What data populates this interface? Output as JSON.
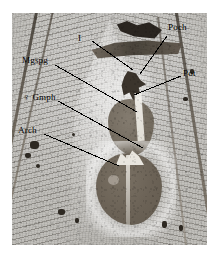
{
  "figure": {
    "kind": "histological-section-micrograph",
    "caption_labels_present": true
  },
  "labels": [
    {
      "id": "I",
      "text": "I",
      "symbol": "",
      "x": 78,
      "y": 33,
      "leader": {
        "x1": 92,
        "y1": 41,
        "x2": 133,
        "y2": 70
      }
    },
    {
      "id": "Mgspg",
      "text": "Mgspg",
      "symbol": "",
      "x": 22,
      "y": 55,
      "leader": {
        "x1": 55,
        "y1": 65,
        "x2": 137,
        "y2": 112
      }
    },
    {
      "id": "Gmph",
      "text": "Gmph",
      "symbol": "♀",
      "x": 23,
      "y": 92,
      "leader": {
        "x1": 58,
        "y1": 101,
        "x2": 143,
        "y2": 148
      }
    },
    {
      "id": "Arch",
      "text": "Arch",
      "symbol": "",
      "x": 18,
      "y": 125,
      "leader": {
        "x1": 44,
        "y1": 134,
        "x2": 119,
        "y2": 166
      }
    },
    {
      "id": "Poch",
      "text": "Poch",
      "symbol": "",
      "x": 168,
      "y": 22,
      "leader": {
        "x1": 167,
        "y1": 36,
        "x2": 140,
        "y2": 74
      }
    },
    {
      "id": "Pot",
      "text": "Pot",
      "symbol": "",
      "x": 183,
      "y": 68,
      "leader": {
        "x1": 181,
        "y1": 76,
        "x2": 134,
        "y2": 95
      }
    }
  ],
  "colors": {
    "plate_background": "#b6b4af",
    "tissue_dark": "#3a342c",
    "gonad": "#6b6256",
    "leader_line": "#000000",
    "page_background": "#ffffff"
  },
  "plate": {
    "left": 12,
    "top": 13,
    "width": 195,
    "height": 232
  }
}
